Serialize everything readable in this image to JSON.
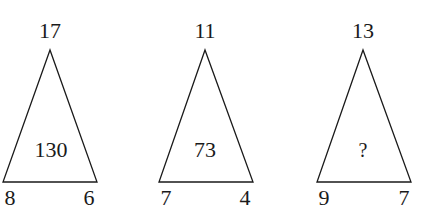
{
  "puzzle": {
    "triangles": [
      {
        "top": "17",
        "center": "130",
        "bottom_left": "8",
        "bottom_right": "6"
      },
      {
        "top": "11",
        "center": "73",
        "bottom_left": "7",
        "bottom_right": "4"
      },
      {
        "top": "13",
        "center": "?",
        "bottom_left": "9",
        "bottom_right": "7"
      }
    ]
  }
}
